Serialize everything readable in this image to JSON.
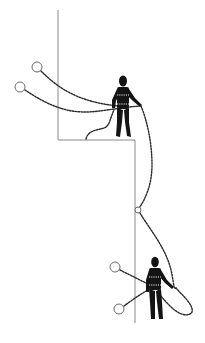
{
  "illustration": {
    "subject": "Two climbers connected by dotted ropes on a stepped wall / ledge",
    "colors": {
      "background": "#ffffff",
      "wall": "#8a8a8a",
      "rope": "#2a2a2a",
      "figure": "#141414",
      "anchor": "#6a6a6a"
    },
    "elements": {
      "wall": "stepped-wall-outline",
      "upper_climber": "person-silhouette-on-ledge",
      "lower_climber": "person-silhouette-below",
      "anchors": [
        "anchor-ring-top-left-1",
        "anchor-ring-top-left-2",
        "belay-ring-mid",
        "anchor-ring-bottom-1",
        "anchor-ring-bottom-2"
      ],
      "ropes": [
        "rope-upper-1",
        "rope-upper-2",
        "rope-slack-ledge",
        "rope-descent",
        "rope-lower-1",
        "rope-lower-2",
        "rope-lower-loop"
      ]
    }
  }
}
